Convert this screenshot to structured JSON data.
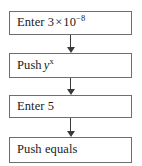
{
  "diagram": {
    "type": "flowchart",
    "orientation": "vertical",
    "colors": {
      "box_border": "#6e6e6e",
      "box_fill": "#ffffff",
      "arrow": "#3a3a3a",
      "text": "#1a1a1a",
      "page_background": "#ffffff"
    },
    "steps": [
      {
        "id": "step-1",
        "order": 1,
        "text": "Enter 3 × 10⁻⁸",
        "parts": {
          "lead": "Enter 3",
          "times": "×",
          "base": "10",
          "exponent": "−8"
        }
      },
      {
        "id": "step-2",
        "order": 2,
        "text": "Push yˣ",
        "parts": {
          "lead": "Push",
          "variable": "y",
          "exponent": "x"
        }
      },
      {
        "id": "step-3",
        "order": 3,
        "text": "Enter 5",
        "parts": {
          "lead": "Enter 5"
        }
      },
      {
        "id": "step-4",
        "order": 4,
        "text": "Push equals",
        "parts": {
          "lead": "Push equals"
        }
      }
    ],
    "connectors": [
      {
        "id": "arrow-1",
        "from": "step-1",
        "to": "step-2",
        "direction": "down"
      },
      {
        "id": "arrow-2",
        "from": "step-2",
        "to": "step-3",
        "direction": "down"
      },
      {
        "id": "arrow-3",
        "from": "step-3",
        "to": "step-4",
        "direction": "down"
      }
    ]
  }
}
